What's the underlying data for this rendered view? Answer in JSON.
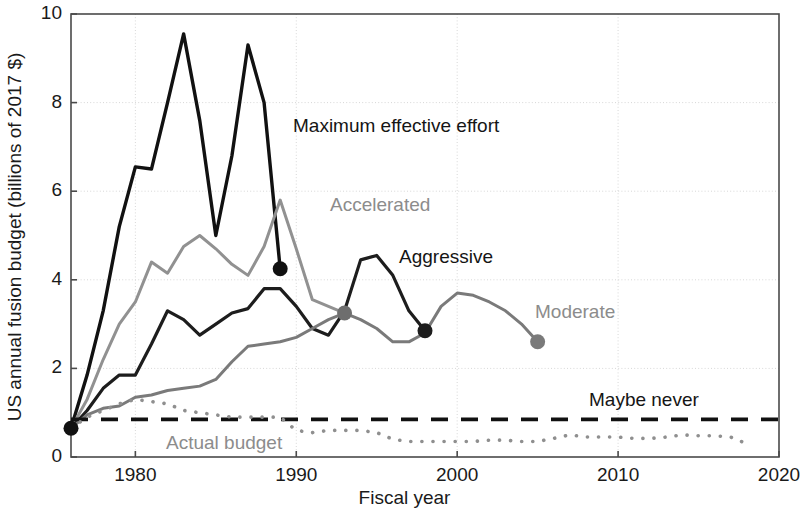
{
  "chart_data": {
    "type": "line",
    "title": "",
    "xlabel": "Fiscal year",
    "ylabel": "US annual fusion budget (billions of 2017 $)",
    "xlim": [
      1976,
      2020
    ],
    "ylim": [
      0,
      10
    ],
    "xticks": [
      1980,
      1990,
      2000,
      2010,
      2020
    ],
    "yticks": [
      0,
      2,
      4,
      6,
      8,
      10
    ],
    "xtick_labels": [
      "1980",
      "1990",
      "2000",
      "2010",
      "2020"
    ],
    "ytick_labels": [
      "0",
      "2",
      "4",
      "6",
      "8",
      "10"
    ],
    "grid": true,
    "legend_position": "inline-annotations",
    "colors": {
      "maximum_effective_effort": "#111111",
      "accelerated": "#919191",
      "aggressive": "#1d1d1d",
      "moderate": "#7a7a7a",
      "maybe_never": "#111111",
      "actual_budget": "#8f8f8f",
      "grid": "#d7d7d7",
      "axis": "#4a4a4a"
    },
    "series": [
      {
        "name": "Maximum effective effort",
        "style": "solid",
        "color": "#111111",
        "linewidth": 3.4,
        "end_marker": true,
        "x": [
          1976,
          1977,
          1978,
          1979,
          1980,
          1981,
          1982,
          1983,
          1984,
          1985,
          1986,
          1987,
          1988,
          1989
        ],
        "y": [
          0.65,
          1.85,
          3.3,
          5.2,
          6.55,
          6.5,
          8.0,
          9.55,
          7.6,
          5.0,
          6.8,
          9.3,
          8.0,
          4.25
        ]
      },
      {
        "name": "Accelerated",
        "style": "solid",
        "color": "#919191",
        "linewidth": 3.0,
        "end_marker": true,
        "x": [
          1976,
          1977,
          1978,
          1979,
          1980,
          1981,
          1982,
          1983,
          1984,
          1985,
          1986,
          1987,
          1988,
          1989,
          1990,
          1991,
          1992,
          1993
        ],
        "y": [
          0.65,
          1.3,
          2.2,
          3.0,
          3.5,
          4.4,
          4.15,
          4.75,
          5.0,
          4.7,
          4.35,
          4.1,
          4.75,
          5.8,
          4.7,
          3.55,
          3.4,
          3.25
        ]
      },
      {
        "name": "Aggressive",
        "style": "solid",
        "color": "#1d1d1d",
        "linewidth": 3.2,
        "end_marker": true,
        "x": [
          1976,
          1977,
          1978,
          1979,
          1980,
          1981,
          1982,
          1983,
          1984,
          1985,
          1986,
          1987,
          1988,
          1989,
          1990,
          1991,
          1992,
          1993,
          1994,
          1995,
          1996,
          1997,
          1998
        ],
        "y": [
          0.65,
          1.05,
          1.55,
          1.85,
          1.85,
          2.55,
          3.3,
          3.1,
          2.75,
          3.0,
          3.25,
          3.35,
          3.8,
          3.8,
          3.4,
          2.9,
          2.75,
          3.3,
          4.45,
          4.55,
          4.1,
          3.3,
          2.85
        ]
      },
      {
        "name": "Moderate",
        "style": "solid",
        "color": "#7a7a7a",
        "linewidth": 3.0,
        "end_marker": true,
        "x": [
          1976,
          1977,
          1978,
          1979,
          1980,
          1981,
          1982,
          1983,
          1984,
          1985,
          1986,
          1987,
          1988,
          1989,
          1990,
          1991,
          1992,
          1993,
          1994,
          1995,
          1996,
          1997,
          1998,
          1999,
          2000,
          2001,
          2002,
          2003,
          2004,
          2005
        ],
        "y": [
          0.65,
          0.95,
          1.1,
          1.15,
          1.35,
          1.4,
          1.5,
          1.55,
          1.6,
          1.75,
          2.15,
          2.5,
          2.55,
          2.6,
          2.7,
          2.9,
          3.1,
          3.25,
          3.1,
          2.9,
          2.6,
          2.6,
          2.8,
          3.4,
          3.7,
          3.65,
          3.5,
          3.3,
          3.0,
          2.6
        ]
      },
      {
        "name": "Maybe never",
        "style": "dashed",
        "color": "#111111",
        "linewidth": 3.6,
        "end_marker": false,
        "x": [
          1976,
          2020
        ],
        "y": [
          0.85,
          0.85
        ]
      },
      {
        "name": "Actual budget",
        "style": "dotted",
        "color": "#8f8f8f",
        "linewidth": 3.6,
        "end_marker": false,
        "x": [
          1976,
          1977,
          1978,
          1979,
          1980,
          1981,
          1982,
          1983,
          1984,
          1985,
          1986,
          1987,
          1988,
          1989,
          1990,
          1991,
          1992,
          1993,
          1994,
          1995,
          1996,
          1997,
          1998,
          1999,
          2000,
          2001,
          2002,
          2003,
          2004,
          2005,
          2006,
          2007,
          2008,
          2009,
          2010,
          2011,
          2012,
          2013,
          2014,
          2015,
          2016,
          2017,
          2018
        ],
        "y": [
          0.65,
          0.9,
          1.05,
          1.2,
          1.3,
          1.25,
          1.2,
          1.05,
          1.0,
          0.95,
          0.9,
          0.9,
          0.9,
          0.9,
          0.6,
          0.55,
          0.6,
          0.6,
          0.6,
          0.55,
          0.4,
          0.35,
          0.35,
          0.35,
          0.35,
          0.35,
          0.38,
          0.38,
          0.35,
          0.35,
          0.42,
          0.5,
          0.45,
          0.45,
          0.45,
          0.42,
          0.42,
          0.45,
          0.5,
          0.48,
          0.48,
          0.45,
          0.3
        ]
      }
    ],
    "markers": [
      {
        "label": "Maximum effective effort end",
        "x": 1989,
        "y": 4.25,
        "color": "#111111"
      },
      {
        "label": "Accelerated end",
        "x": 1993,
        "y": 3.25,
        "color": "#6e6e6e"
      },
      {
        "label": "Aggressive end",
        "x": 1998,
        "y": 2.85,
        "color": "#1d1d1d"
      },
      {
        "label": "Moderate end",
        "x": 2005,
        "y": 2.6,
        "color": "#7a7a7a"
      },
      {
        "label": "Common origin",
        "x": 1976,
        "y": 0.65,
        "color": "#111111"
      }
    ],
    "annotations": [
      {
        "id": "maximum-effective-effort",
        "text": "Maximum effective effort",
        "x_px": 293,
        "y_px": 115,
        "color": "dark"
      },
      {
        "id": "accelerated",
        "text": "Accelerated",
        "x_px": 330,
        "y_px": 194,
        "color": "gray"
      },
      {
        "id": "aggressive",
        "text": "Aggressive",
        "x_px": 399,
        "y_px": 246,
        "color": "dark"
      },
      {
        "id": "moderate",
        "text": "Moderate",
        "x_px": 535,
        "y_px": 301,
        "color": "gray"
      },
      {
        "id": "maybe-never",
        "text": "Maybe never",
        "x_px": 589,
        "y_px": 389,
        "color": "dark"
      },
      {
        "id": "actual-budget",
        "text": "Actual budget",
        "x_px": 166,
        "y_px": 432,
        "color": "gray"
      }
    ]
  }
}
